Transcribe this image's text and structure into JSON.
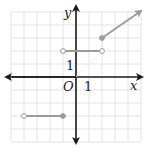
{
  "chart_data": {
    "type": "line",
    "title": "",
    "xlabel": "x",
    "ylabel": "y",
    "origin_label": "O",
    "x_tick_label": "1",
    "y_tick_label": "1",
    "xlim": [
      -5,
      5
    ],
    "ylim": [
      -5,
      5
    ],
    "grid": true,
    "legend": null,
    "series": [
      {
        "name": "segment-lower",
        "points": [
          [
            -4,
            -3
          ],
          [
            -1,
            -3
          ]
        ],
        "left_endpoint": "open",
        "right_endpoint": "closed"
      },
      {
        "name": "segment-middle",
        "points": [
          [
            -1,
            2
          ],
          [
            2,
            2
          ]
        ],
        "left_endpoint": "open",
        "right_endpoint": "open"
      },
      {
        "name": "ray-upper",
        "points": [
          [
            2,
            3
          ],
          [
            5,
            5.5
          ]
        ],
        "left_endpoint": "closed",
        "right_endpoint": "arrow"
      }
    ],
    "colors": {
      "axis": "#1a1a1a",
      "grid": "#e2e2e2",
      "curve": "#9a9a9a"
    }
  }
}
